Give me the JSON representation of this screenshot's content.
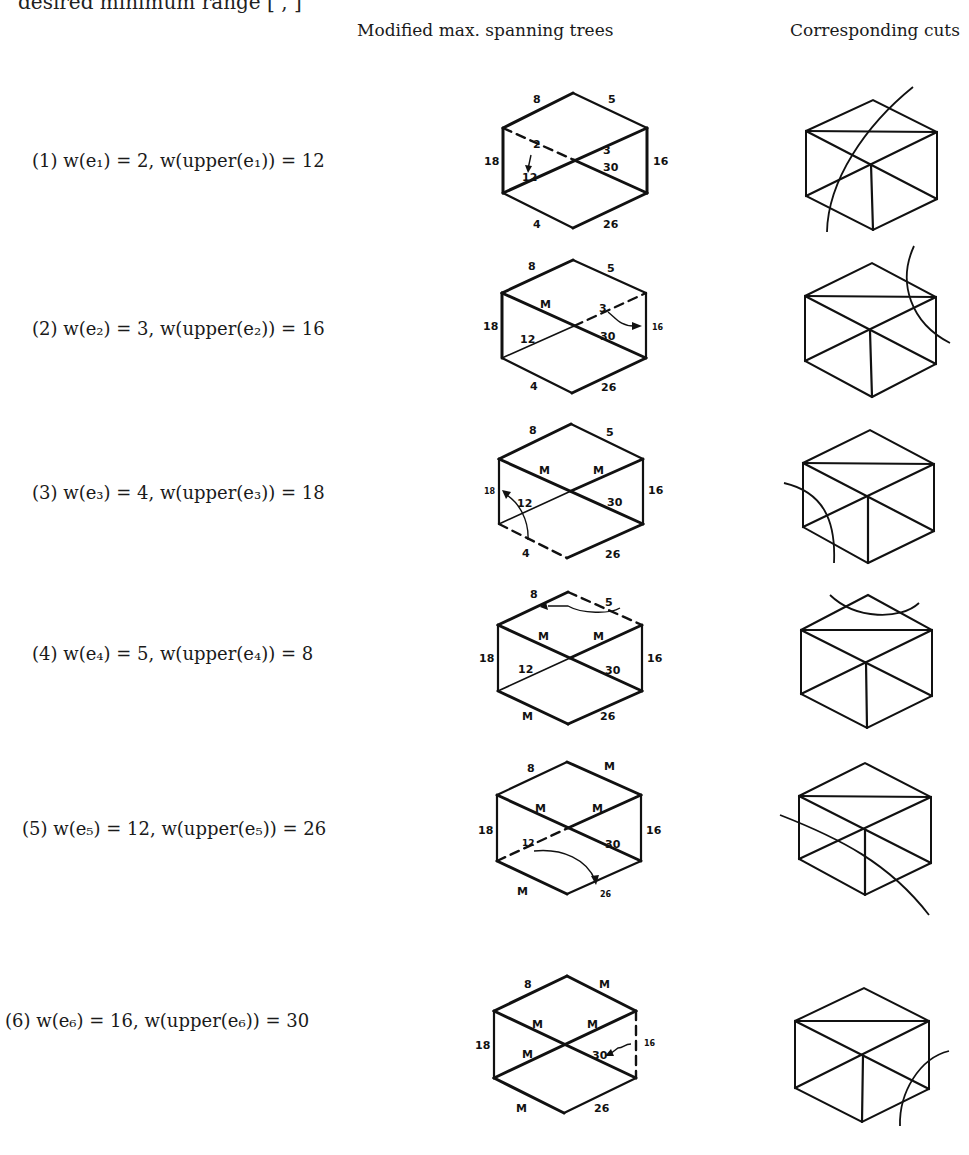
{
  "top_fragment": "desired minimum range [ , ]",
  "headers": {
    "trees": "Modified max. spanning trees",
    "cuts": "Corresponding cuts"
  },
  "rows": [
    {
      "num": "(1)",
      "e": "e₁",
      "w": "2",
      "upper": "12",
      "label": "(1) w(e₁) = 2, w(upper(e₁)) = 12",
      "tree_labels": {
        "top_left": "8",
        "top_right": "5",
        "left": "18",
        "right": "16",
        "bottom_left": "4",
        "bottom_right": "26",
        "diag_ul": "2",
        "diag_ur": "3",
        "diag_ll": "12",
        "diag_lr": "30"
      },
      "dashed_edge": "diag_ul",
      "arrow": "2 -> 12"
    },
    {
      "num": "(2)",
      "e": "e₂",
      "w": "3",
      "upper": "16",
      "label": "(2) w(e₂) = 3, w(upper(e₂)) = 16",
      "tree_labels": {
        "top_left": "8",
        "top_right": "5",
        "left": "18",
        "right": "16",
        "bottom_left": "4",
        "bottom_right": "26",
        "diag_ul": "M",
        "diag_ur": "3",
        "diag_ll": "12",
        "diag_lr": "30"
      },
      "dashed_edge": "diag_ur",
      "arrow": "3 -> 16"
    },
    {
      "num": "(3)",
      "e": "e₃",
      "w": "4",
      "upper": "18",
      "label": "(3) w(e₃) = 4, w(upper(e₃)) = 18",
      "tree_labels": {
        "top_left": "8",
        "top_right": "5",
        "left": "18",
        "right": "16",
        "bottom_left": "4",
        "bottom_right": "26",
        "diag_ul": "M",
        "diag_ur": "M",
        "diag_ll": "12",
        "diag_lr": "30"
      },
      "dashed_edge": "bottom_left",
      "arrow": "4 -> 18"
    },
    {
      "num": "(4)",
      "e": "e₄",
      "w": "5",
      "upper": "8",
      "label": "(4) w(e₄) = 5, w(upper(e₄)) = 8",
      "tree_labels": {
        "top_left": "8",
        "top_right": "5",
        "left": "18",
        "right": "16",
        "bottom_left": "M",
        "bottom_right": "26",
        "diag_ul": "M",
        "diag_ur": "M",
        "diag_ll": "12",
        "diag_lr": "30"
      },
      "dashed_edge": "top_right",
      "arrow": "5 -> 8"
    },
    {
      "num": "(5)",
      "e": "e₅",
      "w": "12",
      "upper": "26",
      "label": "(5) w(e₅) = 12, w(upper(e₅)) = 26",
      "tree_labels": {
        "top_left": "8",
        "top_right": "M",
        "left": "18",
        "right": "16",
        "bottom_left": "M",
        "bottom_right": "26",
        "diag_ul": "M",
        "diag_ur": "M",
        "diag_ll": "12",
        "diag_lr": "30"
      },
      "dashed_edge": "diag_ll",
      "arrow": "12 -> 26"
    },
    {
      "num": "(6)",
      "e": "e₆",
      "w": "16",
      "upper": "30",
      "label": "(6) w(e₆) = 16, w(upper(e₆)) = 30",
      "tree_labels": {
        "top_left": "8",
        "top_right": "M",
        "left": "18",
        "right": "16",
        "bottom_left": "M",
        "bottom_right": "26",
        "diag_ul": "M",
        "diag_ur": "M",
        "diag_ll": "M",
        "diag_lr": "30"
      },
      "dashed_edge": "right",
      "arrow": "16 -> 30"
    }
  ]
}
